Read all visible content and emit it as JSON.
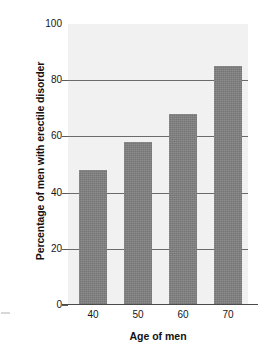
{
  "chart_data": {
    "type": "bar",
    "title": "",
    "subtitle": "",
    "xlabel": "Age of men",
    "ylabel": "Percentage of men with erectile disorder",
    "categories": [
      "40",
      "50",
      "60",
      "70"
    ],
    "values": [
      48,
      58,
      68,
      85
    ],
    "x_tick_labels": [
      "40",
      "50",
      "60",
      "70"
    ],
    "y_tick_labels": [
      "100",
      "80",
      "60",
      "40",
      "20",
      "0"
    ],
    "y_ticks": [
      100,
      80,
      60,
      40,
      20,
      0
    ],
    "ylim": [
      0,
      100
    ],
    "grid": "horizontal",
    "legend": "none",
    "bar_color": "#757575",
    "plot_background": "#f1f1f1",
    "gridline_color": "#6b6b6b",
    "axis_color": "#4a4a4a"
  },
  "axes": {
    "y_title": "Percentage of men with erectile disorder",
    "x_title": "Age of men",
    "y_tick_0": "0",
    "y_tick_20": "20",
    "y_tick_40": "40",
    "y_tick_60": "60",
    "y_tick_80": "80",
    "y_tick_100": "100",
    "x_tick_0": "40",
    "x_tick_1": "50",
    "x_tick_2": "60",
    "x_tick_3": "70"
  }
}
